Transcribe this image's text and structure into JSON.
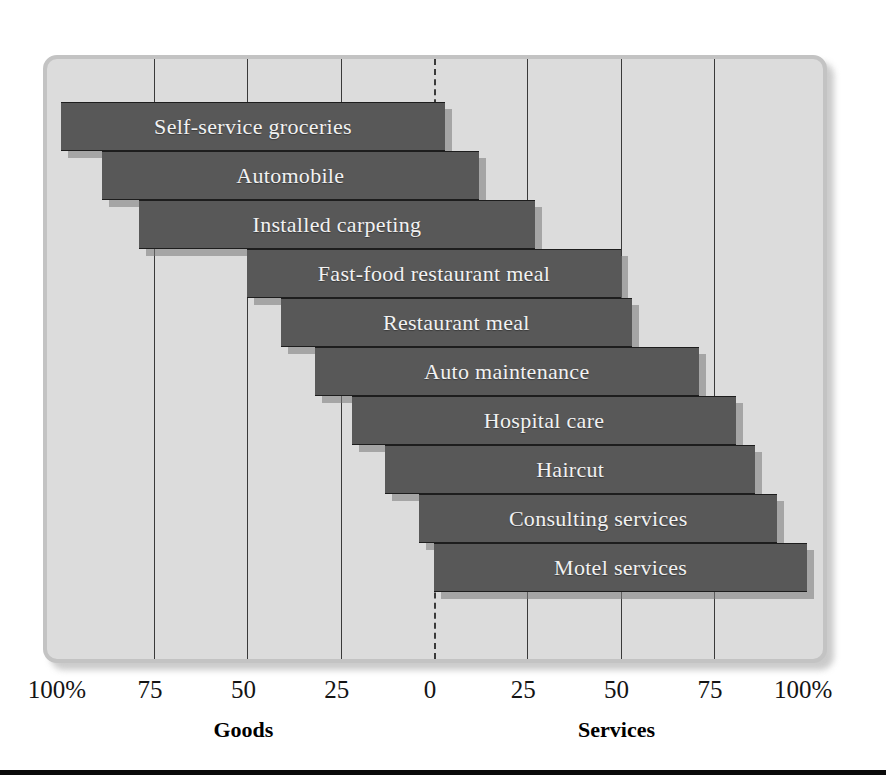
{
  "chart_data": {
    "type": "bar",
    "orientation": "horizontal-diverging",
    "title": "",
    "subtitle": "",
    "xlabel": "",
    "ylabel": "",
    "xlim": [
      -100,
      100
    ],
    "grid": true,
    "legend": null,
    "left_axis_name": "Goods",
    "right_axis_name": "Services",
    "tick_labels_left": [
      "100%",
      "75",
      "50",
      "25"
    ],
    "tick_labels_center": "0",
    "tick_labels_right": [
      "25",
      "50",
      "75",
      "100%"
    ],
    "tick_values": [
      -100,
      -75,
      -50,
      -25,
      0,
      25,
      50,
      75,
      100
    ],
    "tick_texts": [
      "100%",
      "75",
      "50",
      "25",
      "0",
      "25",
      "50",
      "75",
      "100%"
    ],
    "categories": [
      "Self-service groceries",
      "Automobile",
      "Installed carpeting",
      "Fast-food restaurant meal",
      "Restaurant meal",
      "Auto maintenance",
      "Hospital care",
      "Haircut",
      "Consulting services",
      "Motel services"
    ],
    "goods_percent": [
      100,
      89,
      79,
      50,
      41,
      32,
      22,
      13,
      4,
      0
    ],
    "services_percent": [
      3,
      12,
      27,
      50,
      53,
      71,
      81,
      86,
      92,
      100
    ],
    "bars": [
      {
        "label": "Self-service groceries",
        "goods": 100,
        "services": 3,
        "start": -100,
        "end": 3
      },
      {
        "label": "Automobile",
        "goods": 89,
        "services": 12,
        "start": -89,
        "end": 12
      },
      {
        "label": "Installed carpeting",
        "goods": 79,
        "services": 27,
        "start": -79,
        "end": 27
      },
      {
        "label": "Fast-food restaurant meal",
        "goods": 50,
        "services": 50,
        "start": -50,
        "end": 50
      },
      {
        "label": "Restaurant meal",
        "goods": 41,
        "services": 53,
        "start": -41,
        "end": 53
      },
      {
        "label": "Auto maintenance",
        "goods": 32,
        "services": 71,
        "start": -32,
        "end": 71
      },
      {
        "label": "Hospital care",
        "goods": 22,
        "services": 81,
        "start": -22,
        "end": 81
      },
      {
        "label": "Haircut",
        "goods": 13,
        "services": 86,
        "start": -13,
        "end": 86
      },
      {
        "label": "Consulting services",
        "goods": 4,
        "services": 92,
        "start": -4,
        "end": 92
      },
      {
        "label": "Motel services",
        "goods": 0,
        "services": 100,
        "start": 0,
        "end": 100
      }
    ],
    "colors": {
      "bar": "#585858",
      "bar_label": "#f2f2f2",
      "panel_background": "#dcdcdc",
      "panel_border": "#c3c3c3",
      "gridline": "#3a3a3a",
      "axis_text": "#141414",
      "page_background": "#ffffff",
      "rule": "#0a0a0a"
    }
  }
}
